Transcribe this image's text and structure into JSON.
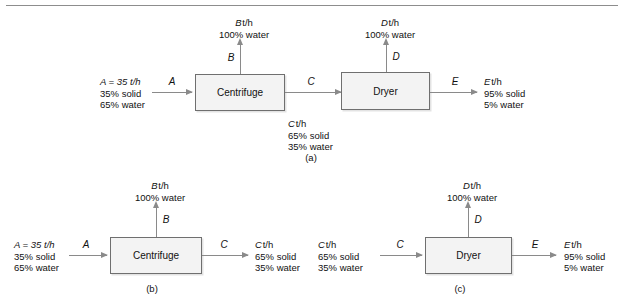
{
  "figure": {
    "rule": "horizontal-rule",
    "units": {
      "centrifuge": "Centrifuge",
      "dryer": "Dryer"
    },
    "stream_letters": {
      "A": "A",
      "B": "B",
      "C": "C",
      "D": "D",
      "E": "E"
    },
    "text_blocks": {
      "feed": {
        "l1": "A = 35 t/h",
        "l2": "35% solid",
        "l3": "65% water"
      },
      "B_stream": {
        "l1": "B t/h",
        "l2": "100% water"
      },
      "C_stream": {
        "l1": "C t/h",
        "l2": "65% solid",
        "l3": "35% water"
      },
      "D_stream": {
        "l1": "D t/h",
        "l2": "100% water"
      },
      "E_stream": {
        "l1": "E t/h",
        "l2": "95% solid",
        "l3": "5% water"
      }
    },
    "captions": {
      "a": "(a)",
      "b": "(b)",
      "c": "(c)"
    },
    "colors": {
      "box_fill": "#f3f3f3",
      "box_stroke": "#6f6f6f",
      "arrow": "#8a8a8a",
      "text": "#111111",
      "rule": "#8d8d8d"
    }
  }
}
